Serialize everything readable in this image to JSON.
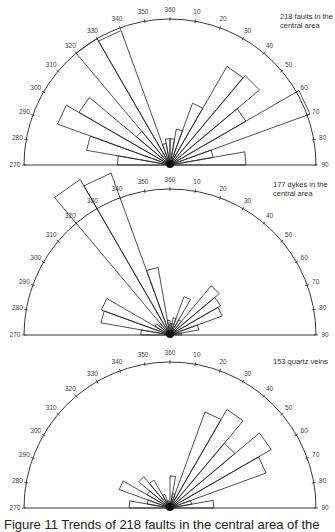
{
  "figure": {
    "caption": "Figure 11   Trends of 218 faults in the central area of the"
  },
  "chart_data": [
    {
      "type": "rose",
      "title": "218 faults in the central area",
      "label_lines": [
        "218 faults in the",
        "central area"
      ],
      "axis": {
        "range_deg": [
          270,
          90
        ],
        "tick_step_deg": 10,
        "tick_labels": [
          "270",
          "280",
          "290",
          "300",
          "310",
          "320",
          "330",
          "340",
          "350",
          "360",
          "10",
          "20",
          "30",
          "40",
          "50",
          "60",
          "70",
          "80",
          "90"
        ]
      },
      "bin_width_deg": 10,
      "bins": [
        {
          "from": 270,
          "to": 280,
          "relative_length": 0.36
        },
        {
          "from": 280,
          "to": 290,
          "relative_length": 0.58
        },
        {
          "from": 290,
          "to": 300,
          "relative_length": 0.82
        },
        {
          "from": 300,
          "to": 310,
          "relative_length": 0.72
        },
        {
          "from": 310,
          "to": 320,
          "relative_length": 0.3
        },
        {
          "from": 320,
          "to": 330,
          "relative_length": 1.0
        },
        {
          "from": 330,
          "to": 340,
          "relative_length": 0.98
        },
        {
          "from": 340,
          "to": 350,
          "relative_length": 0.15
        },
        {
          "from": 350,
          "to": 360,
          "relative_length": 0.18
        },
        {
          "from": 0,
          "to": 10,
          "relative_length": 0.18
        },
        {
          "from": 10,
          "to": 20,
          "relative_length": 0.25
        },
        {
          "from": 20,
          "to": 30,
          "relative_length": 0.45
        },
        {
          "from": 30,
          "to": 40,
          "relative_length": 0.78
        },
        {
          "from": 40,
          "to": 50,
          "relative_length": 0.8
        },
        {
          "from": 50,
          "to": 60,
          "relative_length": 0.6
        },
        {
          "from": 60,
          "to": 70,
          "relative_length": 1.02
        },
        {
          "from": 70,
          "to": 80,
          "relative_length": 0.3
        },
        {
          "from": 80,
          "to": 90,
          "relative_length": 0.52
        }
      ]
    },
    {
      "type": "rose",
      "title": "177 dykes in the central area",
      "label_lines": [
        "177 dykes in the",
        "central area"
      ],
      "axis": {
        "range_deg": [
          270,
          90
        ],
        "tick_step_deg": 10,
        "tick_labels": [
          "270",
          "280",
          "290",
          "300",
          "310",
          "320",
          "330",
          "340",
          "350",
          "360",
          "10",
          "20",
          "30",
          "40",
          "50",
          "60",
          "70",
          "80",
          "90"
        ]
      },
      "bin_width_deg": 10,
      "bins": [
        {
          "from": 270,
          "to": 280,
          "relative_length": 0.2
        },
        {
          "from": 280,
          "to": 290,
          "relative_length": 0.48
        },
        {
          "from": 290,
          "to": 300,
          "relative_length": 0.5
        },
        {
          "from": 300,
          "to": 310,
          "relative_length": 0.12
        },
        {
          "from": 310,
          "to": 320,
          "relative_length": 0.1
        },
        {
          "from": 320,
          "to": 330,
          "relative_length": 1.23
        },
        {
          "from": 330,
          "to": 340,
          "relative_length": 1.18
        },
        {
          "from": 340,
          "to": 350,
          "relative_length": 0.47
        },
        {
          "from": 350,
          "to": 360,
          "relative_length": 0.1
        },
        {
          "from": 0,
          "to": 10,
          "relative_length": 0.08
        },
        {
          "from": 10,
          "to": 20,
          "relative_length": 0.12
        },
        {
          "from": 20,
          "to": 30,
          "relative_length": 0.28
        },
        {
          "from": 30,
          "to": 40,
          "relative_length": 0.12
        },
        {
          "from": 40,
          "to": 50,
          "relative_length": 0.44
        },
        {
          "from": 50,
          "to": 60,
          "relative_length": 0.4
        },
        {
          "from": 60,
          "to": 70,
          "relative_length": 0.38
        },
        {
          "from": 70,
          "to": 80,
          "relative_length": 0.2
        },
        {
          "from": 80,
          "to": 90,
          "relative_length": 0.08
        }
      ]
    },
    {
      "type": "rose",
      "title": "153 quartz veins",
      "label_lines": [
        "153 quartz veins"
      ],
      "axis": {
        "range_deg": [
          270,
          90
        ],
        "tick_step_deg": 10,
        "tick_labels": [
          "270",
          "280",
          "290",
          "300",
          "310",
          "320",
          "330",
          "340",
          "350",
          "360",
          "10",
          "20",
          "30",
          "40",
          "50",
          "60",
          "70",
          "80",
          "90"
        ]
      },
      "bin_width_deg": 10,
      "bins": [
        {
          "from": 270,
          "to": 280,
          "relative_length": 0.28
        },
        {
          "from": 280,
          "to": 290,
          "relative_length": 0.16
        },
        {
          "from": 290,
          "to": 300,
          "relative_length": 0.37
        },
        {
          "from": 300,
          "to": 310,
          "relative_length": 0.18
        },
        {
          "from": 310,
          "to": 320,
          "relative_length": 0.28
        },
        {
          "from": 320,
          "to": 330,
          "relative_length": 0.22
        },
        {
          "from": 330,
          "to": 340,
          "relative_length": 0.1
        },
        {
          "from": 340,
          "to": 350,
          "relative_length": 0.05
        },
        {
          "from": 350,
          "to": 360,
          "relative_length": 0.04
        },
        {
          "from": 0,
          "to": 10,
          "relative_length": 0.22
        },
        {
          "from": 10,
          "to": 20,
          "relative_length": 0.1
        },
        {
          "from": 20,
          "to": 30,
          "relative_length": 0.7
        },
        {
          "from": 30,
          "to": 40,
          "relative_length": 0.78
        },
        {
          "from": 40,
          "to": 50,
          "relative_length": 0.58
        },
        {
          "from": 50,
          "to": 60,
          "relative_length": 0.8
        },
        {
          "from": 60,
          "to": 70,
          "relative_length": 0.7
        },
        {
          "from": 70,
          "to": 80,
          "relative_length": 0.15
        },
        {
          "from": 80,
          "to": 90,
          "relative_length": 0.3
        }
      ]
    }
  ],
  "layout": {
    "panels": [
      {
        "top": 0,
        "cx": 170,
        "cy": 165,
        "r": 146,
        "label_x": 280,
        "label_y": 12
      },
      {
        "top": 0,
        "cx": 170,
        "cy": 335,
        "r": 146,
        "label_x": 273,
        "label_y": 180
      },
      {
        "top": 0,
        "cx": 170,
        "cy": 508,
        "r": 146,
        "label_x": 273,
        "label_y": 357
      }
    ],
    "stroke": "#222222",
    "fill": "#ffffff"
  }
}
